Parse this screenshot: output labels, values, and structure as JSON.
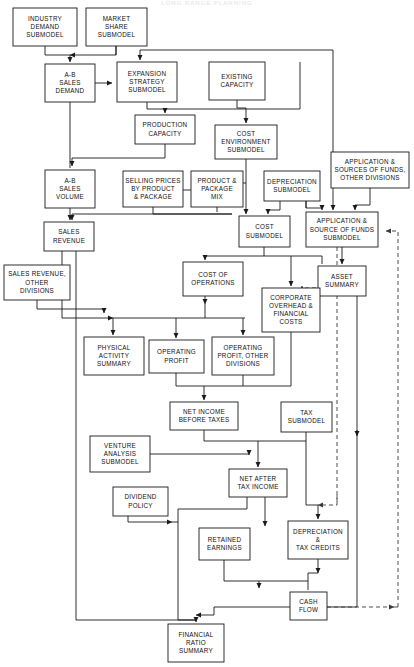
{
  "header": {
    "faint_caption": "LONG RANGE PLANNING"
  },
  "diagram": {
    "type": "flowchart",
    "line_color": "#1a1a1a",
    "dashed_line_color": "#3a3a3a",
    "box_fill": "#ffffff",
    "nodes": [
      {
        "id": "industry_demand",
        "label": "INDUSTRY\nDEMAND\nSUBMODEL",
        "x": 13,
        "y": 8,
        "w": 64,
        "h": 38
      },
      {
        "id": "market_share",
        "label": "MARKET\nSHARE\nSUBMODEL",
        "x": 86,
        "y": 8,
        "w": 61,
        "h": 38
      },
      {
        "id": "ab_sales_demand",
        "label": "A-B\nSALES\nDEMAND",
        "x": 45,
        "y": 64,
        "w": 50,
        "h": 38
      },
      {
        "id": "expansion_strategy",
        "label": "EXPANSION\nSTRATEGY\nSUBMODEL",
        "x": 117,
        "y": 62,
        "w": 60,
        "h": 40
      },
      {
        "id": "existing_capacity",
        "label": "EXISTING\nCAPACITY",
        "x": 209,
        "y": 62,
        "w": 56,
        "h": 38
      },
      {
        "id": "production_capacity",
        "label": "PRODUCTION\nCAPACITY",
        "x": 135,
        "y": 115,
        "w": 60,
        "h": 29
      },
      {
        "id": "cost_environment",
        "label": "COST\nENVIRONMENT\nSUBMODEL",
        "x": 215,
        "y": 125,
        "w": 62,
        "h": 34
      },
      {
        "id": "application_sources_od",
        "label": "APPLICATION &\nSOURCES OF FUNDS,\nOTHER DIVISIONS",
        "x": 331,
        "y": 152,
        "w": 78,
        "h": 36
      },
      {
        "id": "ab_sales_volume",
        "label": "A-B\nSALES\nVOLUME",
        "x": 45,
        "y": 170,
        "w": 50,
        "h": 38
      },
      {
        "id": "selling_prices",
        "label": "SELLING PRICES\nBY PRODUCT\n& PACKAGE",
        "x": 123,
        "y": 171,
        "w": 60,
        "h": 36
      },
      {
        "id": "product_package_mix",
        "label": "PRODUCT &\nPACKAGE\nMIX",
        "x": 191,
        "y": 171,
        "w": 52,
        "h": 36
      },
      {
        "id": "depreciation_submodel",
        "label": "DEPRECIATION\nSUBMODEL",
        "x": 264,
        "y": 171,
        "w": 56,
        "h": 30
      },
      {
        "id": "cost_submodel",
        "label": "COST\nSUBMODEL",
        "x": 239,
        "y": 216,
        "w": 51,
        "h": 31
      },
      {
        "id": "application_source_sub",
        "label": "APPLICATION &\nSOURCE OF FUNDS\nSUBMODEL",
        "x": 306,
        "y": 212,
        "w": 72,
        "h": 35
      },
      {
        "id": "sales_revenue",
        "label": "SALES\nREVENUE",
        "x": 44,
        "y": 222,
        "w": 50,
        "h": 29
      },
      {
        "id": "sales_revenue_od",
        "label": "SALES  REVENUE,\nOTHER\nDIVISIONS",
        "x": 4,
        "y": 265,
        "w": 66,
        "h": 35
      },
      {
        "id": "cost_of_operations",
        "label": "COST OF\nOPERATIONS",
        "x": 183,
        "y": 262,
        "w": 60,
        "h": 34
      },
      {
        "id": "asset_summary",
        "label": "ASSET\nSUMMARY",
        "x": 318,
        "y": 266,
        "w": 48,
        "h": 30
      },
      {
        "id": "corporate_overhead",
        "label": "CORPORATE\nOVERHEAD &\nFINANCIAL\nCOSTS",
        "x": 262,
        "y": 288,
        "w": 58,
        "h": 44
      },
      {
        "id": "physical_activity",
        "label": "PHYSICAL\nACTIVITY\nSUMMARY",
        "x": 84,
        "y": 337,
        "w": 60,
        "h": 38
      },
      {
        "id": "operating_profit",
        "label": "OPERATING\nPROFIT",
        "x": 149,
        "y": 340,
        "w": 55,
        "h": 33
      },
      {
        "id": "operating_profit_od",
        "label": "OPERATING\nPROFIT, OTHER\nDIVISIONS",
        "x": 212,
        "y": 337,
        "w": 62,
        "h": 38
      },
      {
        "id": "net_income_before_tax",
        "label": "NET INCOME\nBEFORE TAXES",
        "x": 170,
        "y": 402,
        "w": 68,
        "h": 28
      },
      {
        "id": "tax_submodel",
        "label": "TAX\nSUBMODEL",
        "x": 281,
        "y": 402,
        "w": 51,
        "h": 30
      },
      {
        "id": "venture_analysis",
        "label": "VENTURE\nANALYSIS\nSUBMODEL",
        "x": 90,
        "y": 436,
        "w": 60,
        "h": 36
      },
      {
        "id": "net_after_tax_income",
        "label": "NET AFTER\nTAX INCOME",
        "x": 229,
        "y": 469,
        "w": 58,
        "h": 28
      },
      {
        "id": "dividend_policy",
        "label": "DIVIDEND\nPOLICY",
        "x": 113,
        "y": 487,
        "w": 55,
        "h": 29
      },
      {
        "id": "retained_earnings",
        "label": "RETAINED\nEARNINGS",
        "x": 199,
        "y": 528,
        "w": 51,
        "h": 32
      },
      {
        "id": "depreciation_tax_credit",
        "label": "DEPRECIATION\n&\nTAX CREDITS",
        "x": 288,
        "y": 521,
        "w": 60,
        "h": 38
      },
      {
        "id": "cash_flow",
        "label": "CASH\nFLOW",
        "x": 290,
        "y": 592,
        "w": 37,
        "h": 28
      },
      {
        "id": "financial_ratio",
        "label": "FINANCIAL\nRATIO\nSUMMARY",
        "x": 168,
        "y": 624,
        "w": 56,
        "h": 38
      }
    ],
    "edges": [
      {
        "from": "industry_demand",
        "to": "ab_sales_demand"
      },
      {
        "from": "market_share",
        "to": "ab_sales_demand"
      },
      {
        "from": "ab_sales_demand",
        "to": "expansion_strategy"
      },
      {
        "from": "ab_sales_demand",
        "to": "ab_sales_volume"
      },
      {
        "from": "expansion_strategy",
        "to": "production_capacity"
      },
      {
        "from": "existing_capacity",
        "to": "cost_environment"
      },
      {
        "from": "production_capacity",
        "to": "ab_sales_volume"
      },
      {
        "from": "cost_environment",
        "to": "cost_submodel"
      },
      {
        "from": "selling_prices",
        "to": "sales_revenue"
      },
      {
        "from": "product_package_mix",
        "to": "cost_submodel"
      },
      {
        "from": "depreciation_submodel",
        "to": "cost_submodel"
      },
      {
        "from": "depreciation_submodel",
        "to": "application_source_sub"
      },
      {
        "from": "application_sources_od",
        "to": "application_source_sub"
      },
      {
        "from": "ab_sales_volume",
        "to": "sales_revenue"
      },
      {
        "from": "sales_revenue",
        "to": "cost_of_operations"
      },
      {
        "from": "sales_revenue_od",
        "to": "operating_profit_od"
      },
      {
        "from": "cost_submodel",
        "to": "cost_of_operations"
      },
      {
        "from": "cost_submodel",
        "to": "corporate_overhead"
      },
      {
        "from": "application_source_sub",
        "to": "asset_summary"
      },
      {
        "from": "cost_of_operations",
        "to": "operating_profit"
      },
      {
        "from": "operating_profit",
        "to": "net_income_before_tax"
      },
      {
        "from": "operating_profit_od",
        "to": "net_income_before_tax"
      },
      {
        "from": "corporate_overhead",
        "to": "net_income_before_tax"
      },
      {
        "from": "net_income_before_tax",
        "to": "net_after_tax_income"
      },
      {
        "from": "tax_submodel",
        "to": "net_after_tax_income"
      },
      {
        "from": "tax_submodel",
        "to": "depreciation_tax_credit"
      },
      {
        "from": "venture_analysis",
        "to": "net_after_tax_income"
      },
      {
        "from": "net_after_tax_income",
        "to": "retained_earnings"
      },
      {
        "from": "dividend_policy",
        "to": "retained_earnings"
      },
      {
        "from": "retained_earnings",
        "to": "cash_flow"
      },
      {
        "from": "depreciation_tax_credit",
        "to": "cash_flow"
      },
      {
        "from": "cash_flow",
        "to": "financial_ratio"
      },
      {
        "from": "asset_summary",
        "to": "financial_ratio"
      }
    ]
  }
}
